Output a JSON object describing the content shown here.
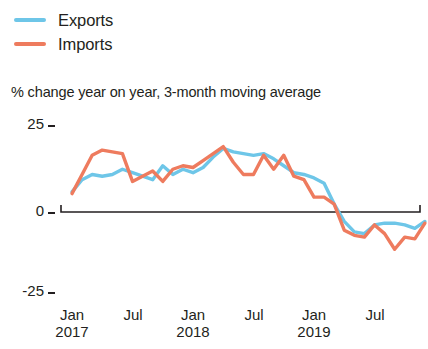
{
  "legend": {
    "position": "top-left",
    "items": [
      {
        "label": "Exports",
        "color": "#6EC6E8",
        "key": "exports"
      },
      {
        "label": "Imports",
        "color": "#EE7B5E",
        "key": "imports"
      }
    ]
  },
  "subtitle": "% change year on year, 3-month moving average",
  "axis": {
    "y_ticks": [
      "25",
      "0",
      "-25"
    ],
    "x_ticks": [
      {
        "month": "Jan",
        "year": "2017"
      },
      {
        "month": "Jul",
        "year": ""
      },
      {
        "month": "Jan",
        "year": "2018"
      },
      {
        "month": "Jul",
        "year": ""
      },
      {
        "month": "Jan",
        "year": "2019"
      },
      {
        "month": "Jul",
        "year": ""
      }
    ]
  },
  "chart_data": {
    "type": "line",
    "title": "",
    "subtitle": "% change year on year, 3-month moving average",
    "xlabel": "",
    "ylabel": "% change year on year",
    "ylim": [
      -25,
      25
    ],
    "yticks": [
      25,
      0,
      -25
    ],
    "grid": false,
    "zero_line": true,
    "legend_position": "top-left",
    "x": [
      "Jan 2017",
      "Feb 2017",
      "Mar 2017",
      "Apr 2017",
      "May 2017",
      "Jun 2017",
      "Jul 2017",
      "Aug 2017",
      "Sep 2017",
      "Oct 2017",
      "Nov 2017",
      "Dec 2017",
      "Jan 2018",
      "Feb 2018",
      "Mar 2018",
      "Apr 2018",
      "May 2018",
      "Jun 2018",
      "Jul 2018",
      "Aug 2018",
      "Sep 2018",
      "Oct 2018",
      "Nov 2018",
      "Dec 2018",
      "Jan 2019",
      "Feb 2019",
      "Mar 2019",
      "Apr 2019",
      "May 2019",
      "Jun 2019",
      "Jul 2019",
      "Aug 2019",
      "Sep 2019",
      "Oct 2019",
      "Nov 2019",
      "Dec 2019"
    ],
    "series": [
      {
        "name": "Exports",
        "color": "#6EC6E8",
        "values": [
          5.5,
          9.0,
          10.5,
          10.0,
          10.5,
          12.0,
          11.0,
          10.0,
          9.0,
          13.0,
          10.5,
          12.0,
          11.0,
          12.5,
          15.5,
          18.0,
          17.0,
          16.5,
          16.0,
          16.5,
          15.0,
          13.0,
          11.0,
          10.5,
          9.5,
          8.0,
          2.0,
          -3.0,
          -6.0,
          -6.5,
          -4.0,
          -3.5,
          -3.5,
          -4.0,
          -5.0,
          -3.0
        ]
      },
      {
        "name": "Imports",
        "color": "#EE7B5E",
        "values": [
          5.0,
          10.5,
          16.0,
          17.5,
          17.0,
          16.5,
          8.5,
          10.0,
          11.5,
          8.5,
          12.0,
          13.0,
          12.5,
          14.5,
          16.5,
          18.5,
          14.0,
          10.5,
          10.5,
          16.0,
          12.0,
          16.0,
          10.0,
          9.0,
          4.0,
          4.0,
          2.0,
          -5.5,
          -7.0,
          -7.5,
          -4.0,
          -6.5,
          -11.0,
          -7.5,
          -8.0,
          -3.5
        ]
      }
    ]
  },
  "geometry": {
    "plot_left": 61,
    "plot_right": 420,
    "y_zero_px": 211,
    "y_25_px": 124,
    "y_neg25_px": 291
  }
}
